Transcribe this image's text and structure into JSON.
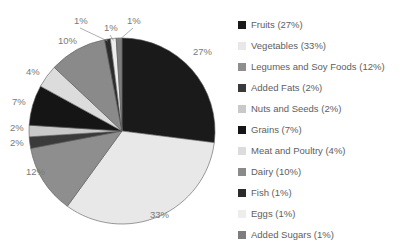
{
  "chart_data": {
    "type": "pie",
    "title": "",
    "legend_position": "right",
    "total_label_suffix": "%",
    "categories": [
      "Fruits",
      "Vegetables",
      "Legumes and Soy Foods",
      "Added Fats",
      "Nuts and Seeds",
      "Grains",
      "Meat and Poultry",
      "Dairy",
      "Fish",
      "Eggs",
      "Added Sugars"
    ],
    "values": [
      27,
      33,
      12,
      2,
      2,
      7,
      4,
      10,
      1,
      1,
      1
    ],
    "slice_labels": [
      "27%",
      "33%",
      "12%",
      "2%",
      "2%",
      "7%",
      "4%",
      "10%",
      "1%",
      "1%",
      "1%"
    ],
    "colors": [
      "#1a1a1a",
      "#e8e8e8",
      "#8e8e8e",
      "#3a3a3a",
      "#c9c9c9",
      "#151515",
      "#dcdcdc",
      "#8a8a8a",
      "#2b2b2b",
      "#ededed",
      "#7d7d7d"
    ],
    "slice_outline_color": "#5a5a5a",
    "label_color": "#7a7a7a",
    "legend_text_color": "#5e5e5e"
  },
  "legend": {
    "items": [
      {
        "label": "Fruits (27%)",
        "swatch": "#1a1a1a"
      },
      {
        "label": "Vegetables (33%)",
        "swatch": "#e8e8e8"
      },
      {
        "label": "Legumes and Soy Foods (12%)",
        "swatch": "#8e8e8e"
      },
      {
        "label": "Added Fats (2%)",
        "swatch": "#3a3a3a"
      },
      {
        "label": "Nuts and Seeds (2%)",
        "swatch": "#c9c9c9"
      },
      {
        "label": "Grains (7%)",
        "swatch": "#151515"
      },
      {
        "label": "Meat and Poultry (4%)",
        "swatch": "#dcdcdc"
      },
      {
        "label": "Dairy (10%)",
        "swatch": "#8a8a8a"
      },
      {
        "label": "Fish (1%)",
        "swatch": "#2b2b2b"
      },
      {
        "label": "Eggs (1%)",
        "swatch": "#ededed"
      },
      {
        "label": "Added Sugars (1%)",
        "swatch": "#7d7d7d"
      }
    ]
  },
  "geometry": {
    "center_x": 122,
    "center_y": 131,
    "radius": 93,
    "label_radius": 108
  }
}
